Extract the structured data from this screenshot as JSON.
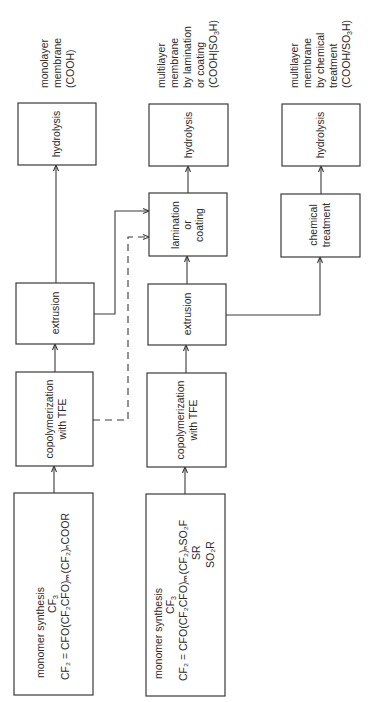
{
  "diagram": {
    "orientation": "rotated 90° counter-clockwise (flow reads bottom to top)",
    "lines": {
      "stroke_color": "#3a3a3a"
    },
    "outputs": {
      "monolayer": [
        "monolayer",
        "membrane",
        "(COOH)"
      ],
      "lamination": [
        "multilayer",
        "membrane",
        "by lamination",
        "or coating",
        "(COOH|SO",
        "3",
        "H)"
      ],
      "chemical": [
        "multilayer",
        "membrane",
        "by chemical",
        "treatment",
        "(COOH/SO",
        "3",
        "H)"
      ]
    },
    "boxes": {
      "hydrolysis_1": "hydrolysis",
      "hydrolysis_2": "hydrolysis",
      "hydrolysis_3": "hydrolysis",
      "lamination": [
        "lamination",
        "or",
        "coating"
      ],
      "chemical_treatment": [
        "chemical",
        "treatment"
      ],
      "extrusion_1": "extrusion",
      "extrusion_2": "extrusion",
      "copolymerization_1": [
        "copolymerization",
        "with TFE"
      ],
      "copolymerization_2": [
        "copolymerization",
        "with TFE"
      ],
      "monomer_1": {
        "title": "monomer synthesis",
        "branch": "CF",
        "branch_sub": "3",
        "formula": "CF₂ = CFO(CF₂CFO)ₘ(CF₂)ₙCOOR"
      },
      "monomer_2": {
        "title": "monomer synthesis",
        "branch": "CF",
        "branch_sub": "3",
        "formula": "CF₂ = CFO(CF₂CFO)ₘ(CF₂)ₙSO₂F",
        "alt_1": "SR",
        "alt_2": "SO₂R"
      }
    },
    "connections": [
      {
        "from": "monomer_1",
        "to": "copolymerization_1",
        "style": "solid"
      },
      {
        "from": "copolymerization_1",
        "to": "extrusion_1",
        "style": "solid"
      },
      {
        "from": "extrusion_1",
        "to": "hydrolysis_1",
        "style": "solid"
      },
      {
        "from": "extrusion_1",
        "to": "lamination",
        "style": "solid"
      },
      {
        "from": "copolymerization_1",
        "to": "lamination",
        "style": "dashed"
      },
      {
        "from": "monomer_2",
        "to": "copolymerization_2",
        "style": "solid"
      },
      {
        "from": "copolymerization_2",
        "to": "extrusion_2",
        "style": "solid"
      },
      {
        "from": "extrusion_2",
        "to": "lamination",
        "style": "solid"
      },
      {
        "from": "lamination",
        "to": "hydrolysis_2",
        "style": "solid"
      },
      {
        "from": "extrusion_2",
        "to": "chemical_treatment",
        "style": "solid"
      },
      {
        "from": "chemical_treatment",
        "to": "hydrolysis_3",
        "style": "solid"
      }
    ]
  }
}
